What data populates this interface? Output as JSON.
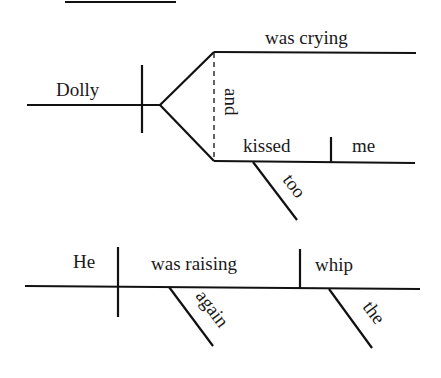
{
  "diagram": {
    "type": "sentence-diagram",
    "sentence_1": {
      "subject": "Dolly",
      "conjunction": "and",
      "predicate_1": {
        "verb": "was crying"
      },
      "predicate_2": {
        "verb": "kissed",
        "object": "me",
        "modifier": "too"
      }
    },
    "sentence_2": {
      "subject": "He",
      "verb": "was raising",
      "verb_modifier": "again",
      "object": "whip",
      "object_modifier": "the"
    }
  }
}
